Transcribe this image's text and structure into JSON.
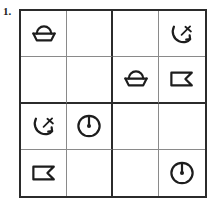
{
  "problem": {
    "number_label": "1."
  },
  "puzzle": {
    "type": "symbol-sudoku",
    "grid_size": 4,
    "box_size": 2,
    "symbol_legend": [
      {
        "key": "bowl",
        "icon_name": "bowl-icon",
        "label": "bowl"
      },
      {
        "key": "anchor",
        "icon_name": "anchor-icon",
        "label": "anchor"
      },
      {
        "key": "flag",
        "icon_name": "flag-icon",
        "label": "flag"
      },
      {
        "key": "clock",
        "icon_name": "clock-icon",
        "label": "clock"
      },
      {
        "key": "empty",
        "icon_name": "empty-cell",
        "label": ""
      }
    ],
    "rows": [
      {
        "cells": [
          "bowl",
          "empty",
          "empty",
          "anchor"
        ]
      },
      {
        "cells": [
          "empty",
          "empty",
          "bowl",
          "flag"
        ]
      },
      {
        "cells": [
          "anchor",
          "clock",
          "empty",
          "empty"
        ]
      },
      {
        "cells": [
          "flag",
          "empty",
          "empty",
          "clock"
        ]
      }
    ]
  },
  "style": {
    "ink": "#1d1d1d",
    "border_heavy": "#2b2b2b",
    "border_light": "#8a8a8a",
    "paper": "#ffffff"
  }
}
